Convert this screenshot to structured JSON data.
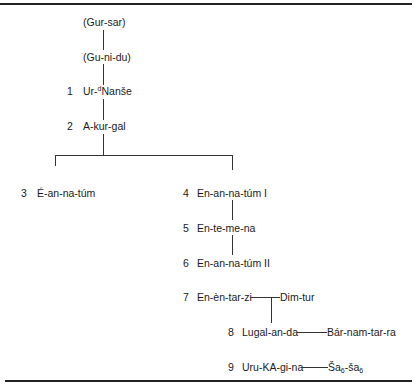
{
  "figure": {
    "title_cropped": "",
    "nodes": {
      "gur_sar": {
        "num": "",
        "name": "(Gur-sar)"
      },
      "gu_ni_du": {
        "num": "",
        "name": "(Gu-ni-du)"
      },
      "ur_nanse": {
        "num": "1",
        "name_pre": "Ur-",
        "name_sup": "d",
        "name_post": "Nanše"
      },
      "a_kur_gal": {
        "num": "2",
        "name": "A-kur-gal"
      },
      "e_an_na_tum": {
        "num": "3",
        "name": "É-an-na-túm"
      },
      "en_an_na_tum_1": {
        "num": "4",
        "name": "En-an-na-túm I"
      },
      "en_te_me_na": {
        "num": "5",
        "name": "En-te-me-na"
      },
      "en_an_na_tum_2": {
        "num": "6",
        "name": "En-an-na-túm II"
      },
      "en_en_tar_zi": {
        "num": "7",
        "name": "En-èn-tar-zi"
      },
      "dim_tur": {
        "num": "",
        "name": "Dim-tur"
      },
      "lugal_an_da": {
        "num": "8",
        "name": "Lugal-an-da"
      },
      "bar_nam_tar_ra": {
        "num": "",
        "name": "Bár-nam-tar-ra"
      },
      "uru_ka_gi_na": {
        "num": "9",
        "name": "Uru-KA-gi-na"
      },
      "sa_sa": {
        "num": "",
        "name_a": "Ša",
        "sub_a": "6",
        "name_b": "-ša",
        "sub_b": "6"
      }
    }
  }
}
